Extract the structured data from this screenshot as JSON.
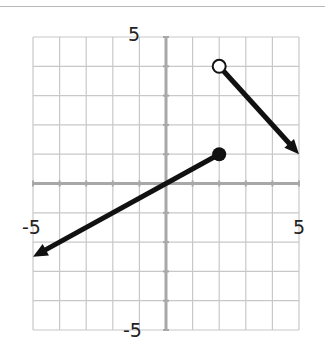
{
  "chart_data": {
    "type": "line",
    "title": "",
    "xlabel": "",
    "ylabel": "",
    "xlim": [
      -5,
      5
    ],
    "ylim": [
      -5,
      5
    ],
    "grid": true,
    "tick_labels": {
      "x_min": "-5",
      "x_max": "5",
      "y_min": "-5",
      "y_max": "5"
    },
    "series": [
      {
        "name": "piece-1",
        "equation": "y = 0.5x",
        "domain": "x <= 2",
        "points": [
          [
            -5,
            -2.5
          ],
          [
            2,
            1
          ]
        ],
        "endpoints": [
          {
            "x": 2,
            "y": 1,
            "style": "closed"
          },
          {
            "x": -5,
            "y": -2.5,
            "style": "arrow"
          }
        ]
      },
      {
        "name": "piece-2",
        "equation": "y = -x + 6",
        "domain": "x > 2",
        "points": [
          [
            2,
            4
          ],
          [
            5,
            1
          ]
        ],
        "endpoints": [
          {
            "x": 2,
            "y": 4,
            "style": "open"
          },
          {
            "x": 5,
            "y": 1,
            "style": "arrow"
          }
        ]
      }
    ]
  },
  "colors": {
    "grid": "#c8c8c8",
    "axis": "#a8a8a8",
    "line": "#111111"
  }
}
